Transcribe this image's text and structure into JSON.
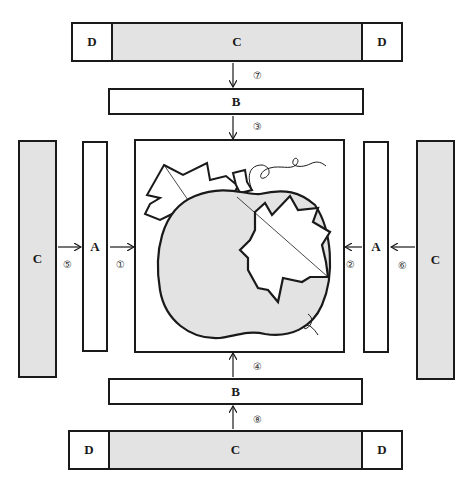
{
  "diagram": {
    "title": "",
    "pieces": {
      "top_strip": {
        "left": "D",
        "center": "C",
        "right": "D"
      },
      "top_b": "B",
      "left_c": "C",
      "left_a": "A",
      "right_a": "A",
      "right_c": "C",
      "bottom_b": "B",
      "bottom_strip": {
        "left": "D",
        "center": "C",
        "right": "D"
      }
    },
    "steps": {
      "s1": "①",
      "s2": "②",
      "s3": "③",
      "s4": "④",
      "s5": "⑤",
      "s6": "⑥",
      "s7": "⑦",
      "s8": "⑧"
    },
    "center_block": {
      "motif": "pumpkin with leaves and vine"
    },
    "colors": {
      "outline": "#1a1a1a",
      "shaded_fill": "#e3e3e3",
      "background": "#ffffff"
    }
  }
}
